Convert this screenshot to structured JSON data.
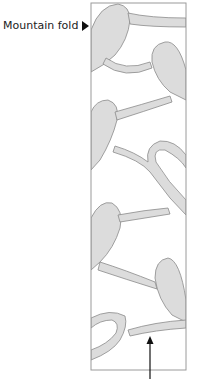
{
  "diagram": {
    "fold_label": "Mountain fold",
    "fold_marker_icon": "triangle-right-icon",
    "arrow_icon": "arrow-up-icon",
    "colors": {
      "shape_fill": "#dcdcdc",
      "shape_stroke": "#8a8a8a",
      "frame_stroke": "#9a9a9a",
      "arrow": "#111111"
    }
  }
}
